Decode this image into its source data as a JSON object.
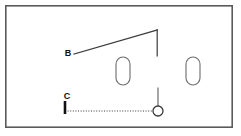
{
  "figure": {
    "type": "technical-line-diagram",
    "canvas": {
      "width": 241,
      "height": 136
    },
    "background_color": "#ffffff",
    "stroke_color": "#3a3a3a",
    "label_color": "#111111",
    "frame": {
      "name": "outer-border",
      "x": 5,
      "y": 5,
      "width": 228,
      "height": 123,
      "stroke_width": 1.6,
      "fill": "none"
    },
    "labels": [
      {
        "id": "label-b",
        "text": "B",
        "x": 68,
        "y": 56
      },
      {
        "id": "label-c",
        "text": "C",
        "x": 67,
        "y": 99
      }
    ],
    "strokes": [
      {
        "id": "diagonal-rising-line",
        "kind": "polyline",
        "points": "74,54 157,30",
        "stroke_width": 1.2,
        "dash": "none"
      },
      {
        "id": "upper-vertical-drop",
        "kind": "line",
        "x1": 157,
        "y1": 30,
        "x2": 157,
        "y2": 56,
        "stroke_width": 1.2,
        "dash": "none"
      },
      {
        "id": "lower-vertical-stem",
        "kind": "line",
        "x1": 158,
        "y1": 88,
        "x2": 158,
        "y2": 106,
        "stroke_width": 1.2,
        "dash": "none"
      },
      {
        "id": "baseline-tick",
        "kind": "line",
        "x1": 65,
        "y1": 101,
        "x2": 65,
        "y2": 114,
        "stroke_width": 2.6,
        "dash": "none"
      },
      {
        "id": "dotted-baseline",
        "kind": "line",
        "x1": 65,
        "y1": 111,
        "x2": 153,
        "y2": 111,
        "stroke_width": 1.1,
        "dash": "1,1.6"
      }
    ],
    "capsules": [
      {
        "id": "capsule-left",
        "x": 116,
        "y": 57,
        "width": 14,
        "height": 28,
        "radius": 7
      },
      {
        "id": "capsule-right",
        "x": 186,
        "y": 57,
        "width": 14,
        "height": 28,
        "radius": 7
      }
    ],
    "nodes": [
      {
        "id": "pivot-circle",
        "cx": 158,
        "cy": 111,
        "r": 5,
        "stroke_width": 1.3,
        "fill": "none"
      }
    ]
  }
}
